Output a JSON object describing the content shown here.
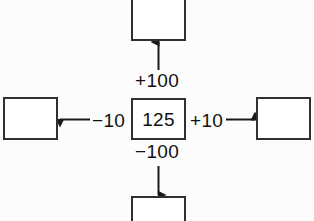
{
  "diagram": {
    "type": "place-value-cross-diagram",
    "background_color": "#fcfcfc",
    "box_border_color": "#303030",
    "text_color": "#111111",
    "center": {
      "name": "center-node",
      "value": "125"
    },
    "nodes": [
      {
        "position": "top",
        "value": "",
        "cropped": true
      },
      {
        "position": "right",
        "value": "",
        "cropped": false
      },
      {
        "position": "bottom",
        "value": "",
        "cropped": true
      },
      {
        "position": "left",
        "value": "",
        "cropped": false
      }
    ],
    "edges": [
      {
        "direction": "up",
        "label": "+100",
        "arrow_to": "top"
      },
      {
        "direction": "down",
        "label": "−100",
        "arrow_to": "bottom"
      },
      {
        "direction": "left",
        "label": "−10",
        "arrow_to": "left"
      },
      {
        "direction": "right",
        "label": "+10",
        "arrow_to": "right"
      }
    ]
  }
}
